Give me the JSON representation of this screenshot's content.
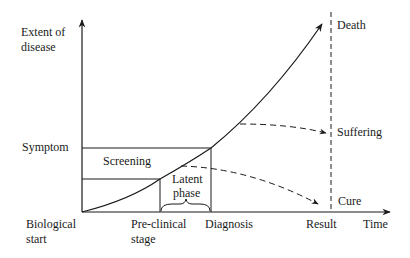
{
  "diagram": {
    "type": "disease-progression-timeline",
    "y_axis": {
      "label_line1": "Extent of",
      "label_line2": "disease"
    },
    "x_axis": {
      "label": "Time"
    },
    "y_markers": {
      "symptom": "Symptom"
    },
    "x_markers": {
      "biological_start_line1": "Biological",
      "biological_start_line2": "start",
      "preclinical_line1": "Pre-clinical",
      "preclinical_line2": "stage",
      "diagnosis": "Diagnosis",
      "result": "Result"
    },
    "regions": {
      "screening": "Screening",
      "latent_line1": "Latent",
      "latent_line2": "phase"
    },
    "outcomes": {
      "death": "Death",
      "suffering": "Suffering",
      "cure": "Cure"
    },
    "colors": {
      "line": "#1a1a1a",
      "background": "#ffffff"
    }
  }
}
